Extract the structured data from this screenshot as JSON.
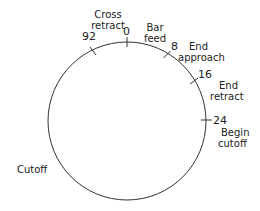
{
  "diagram": {
    "title": "",
    "cycle": {
      "center": [
        127,
        121
      ],
      "radius": 80,
      "stroke_color": "#333333",
      "total_units": 100
    },
    "ticks": [
      {
        "value": "0",
        "position": 0
      },
      {
        "value": "8",
        "position": 8
      },
      {
        "value": "16",
        "position": 16
      },
      {
        "value": "24",
        "position": 24
      },
      {
        "value": "92",
        "position": 92
      }
    ],
    "events": [
      {
        "label_line1": "Cross",
        "label_line2": "retract"
      },
      {
        "label_line1": "Bar",
        "label_line2": "feed"
      },
      {
        "label_line1": "End",
        "label_line2": "approach"
      },
      {
        "label_line1": "End",
        "label_line2": "retract"
      },
      {
        "label_line1": "Begin",
        "label_line2": "cutoff"
      },
      {
        "label_line1": "Cutoff",
        "label_line2": ""
      }
    ]
  }
}
